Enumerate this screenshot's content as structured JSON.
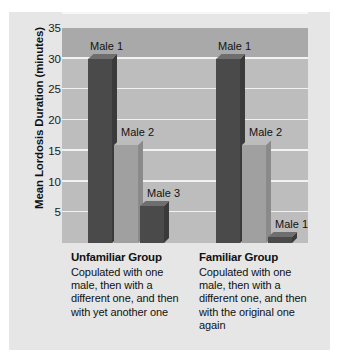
{
  "chart_data": {
    "type": "bar",
    "title": "",
    "xlabel": "",
    "ylabel": "Mean Lordosis Duration (minutes)",
    "ylim": [
      0,
      35
    ],
    "yticks": [
      5,
      10,
      15,
      20,
      25,
      30,
      35
    ],
    "grid": true,
    "legend": "none",
    "categories": [
      "Unfamiliar Group",
      "Familiar Group"
    ],
    "groups": [
      {
        "category": "Unfamiliar Group",
        "bars": [
          {
            "label": "Male 1",
            "value": 30,
            "shade": "dark"
          },
          {
            "label": "Male 2",
            "value": 16,
            "shade": "light"
          },
          {
            "label": "Male 3",
            "value": 6,
            "shade": "dark"
          }
        ]
      },
      {
        "category": "Familiar Group",
        "bars": [
          {
            "label": "Male 1",
            "value": 30,
            "shade": "dark"
          },
          {
            "label": "Male 2",
            "value": 16,
            "shade": "light"
          },
          {
            "label": "Male 1",
            "value": 1,
            "shade": "dark"
          }
        ]
      }
    ],
    "annotations": [
      "Male 1",
      "Male 2",
      "Male 3",
      "Male 1",
      "Male 2",
      "Male 1"
    ]
  },
  "captions": [
    {
      "heading": "Unfamiliar Group",
      "text": "Copulated with one male, then with a different one, and then with yet another one"
    },
    {
      "heading": "Familiar Group",
      "text": "Copulated with one male, then with a different one, and then with the original one again"
    }
  ],
  "colors": {
    "figure_background": "#e6e6e6",
    "plot_background": "#bdbdbd",
    "plot_top_band": "#a9a9a9",
    "gridline": "#f2f2f2",
    "bar_dark": "#4a4a4a",
    "bar_light": "#a0a0a0",
    "text": "#111111"
  }
}
